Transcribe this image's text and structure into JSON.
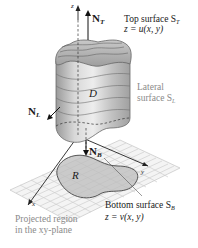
{
  "diagram": {
    "axes": {
      "z": "z",
      "x": "x",
      "y": "y"
    },
    "vectors": {
      "top_normal": {
        "symbol": "N",
        "subscript": "T"
      },
      "lateral_normal": {
        "symbol": "N",
        "subscript": "L"
      },
      "bottom_normal": {
        "symbol": "N",
        "subscript": "B"
      }
    },
    "solid_label": "D",
    "region_label": "R",
    "annotations": {
      "top_surface": {
        "line1": "Top surface S",
        "sub": "T",
        "line2": "z = u(x, y)"
      },
      "lateral_surface": {
        "line1": "Lateral",
        "line2": "surface S",
        "sub": "L"
      },
      "bottom_surface": {
        "line1": "Bottom surface S",
        "sub": "B",
        "line2": "z = v(x, y)"
      },
      "projected_region": {
        "line1": "Projected region",
        "line2": "in the xy-plane"
      }
    },
    "colors": {
      "surface_grey": "#b5b5b5",
      "surface_dark": "#8c8c8c",
      "grid_line": "#c8c8c8",
      "label_grey": "#8a8a8a",
      "ink": "#1a1a1a"
    }
  }
}
